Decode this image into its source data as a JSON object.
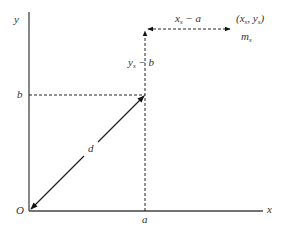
{
  "diagram": {
    "axes": {
      "x_label": "x",
      "y_label": "y",
      "origin_label": "O"
    },
    "point_labels": {
      "a": "a",
      "b": "b"
    },
    "vector_label": "d",
    "vertical_offset_label": {
      "main": "y",
      "sub": "s",
      "rest": " − b"
    },
    "horizontal_offset_label": {
      "main": "x",
      "sub": "s",
      "rest": " − a"
    },
    "target_point_label": {
      "open": "(",
      "x": "x",
      "x_sub": "s",
      "sep": ", ",
      "y": "y",
      "y_sub": "s",
      "close": ")"
    },
    "target_mass_label": {
      "main": "m",
      "sub": "s"
    }
  },
  "colors": {
    "line": "#222222",
    "axis": "#444444",
    "text": "#333333"
  }
}
